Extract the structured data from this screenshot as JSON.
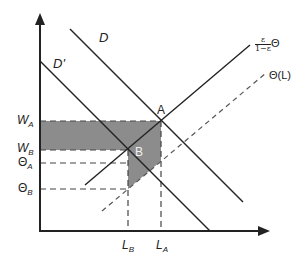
{
  "diagram": {
    "type": "labor-market-supply-demand",
    "curves": {
      "demand": "D",
      "demand_shifted": "D'",
      "supply_num": "ε",
      "supply_den": "1−ε",
      "supply_suffix": "Θ",
      "theta": "Θ(L)"
    },
    "points": {
      "a": "A",
      "b": "B"
    },
    "y_ticks": {
      "wa": {
        "main": "W",
        "sub": "A"
      },
      "wb": {
        "main": "W",
        "sub": "B"
      },
      "theta_a": {
        "main": "Θ",
        "sub": "A"
      },
      "theta_b": {
        "main": "Θ",
        "sub": "B"
      }
    },
    "x_ticks": {
      "lb": {
        "main": "L",
        "sub": "B"
      },
      "la": {
        "main": "L",
        "sub": "A"
      }
    },
    "colors": {
      "line": "#222222",
      "shade": "#8c8c8c",
      "dash": "#444444"
    }
  }
}
